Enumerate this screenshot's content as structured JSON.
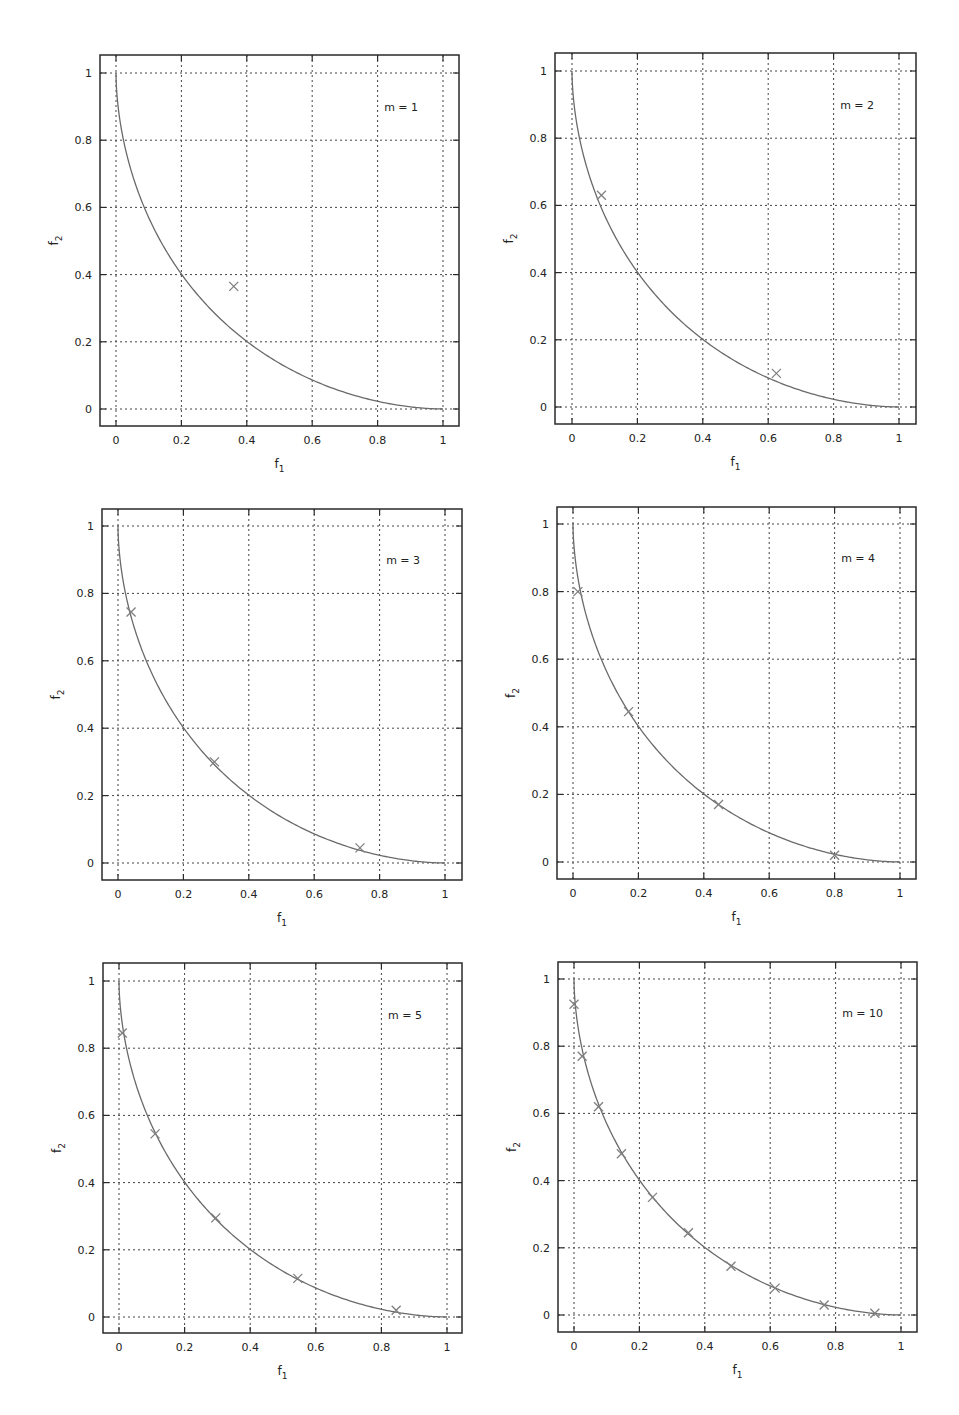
{
  "figure": {
    "panel_count": 6,
    "colors": {
      "frame": "#2a2a2a",
      "grid": "#444444",
      "curve": "#6a6a6a",
      "marker": "#808080",
      "text": "#222222"
    }
  },
  "chart_data": [
    {
      "type": "scatter",
      "title": "",
      "annotation": "m = 1",
      "xlabel": "f1",
      "ylabel": "f2",
      "xlim": [
        -0.05,
        1.05
      ],
      "ylim": [
        -0.05,
        1.05
      ],
      "xticks": [
        "0",
        "0.2",
        "0.4",
        "0.6",
        "0.8",
        "1"
      ],
      "yticks": [
        "0",
        "0.2",
        "0.4",
        "0.6",
        "0.8",
        "1"
      ],
      "grid": true,
      "pixel_frame": {
        "left": 100,
        "top": 55,
        "right": 459,
        "bottom": 426,
        "x0": 116,
        "x1": 443,
        "y0": 409,
        "y1": 73
      },
      "series": [
        {
          "name": "Pareto front",
          "kind": "line",
          "shape_exponent": 0.565
        },
        {
          "name": "solutions",
          "kind": "markers",
          "marker": "x",
          "points": [
            [
              0.36,
              0.365
            ]
          ]
        }
      ]
    },
    {
      "type": "scatter",
      "title": "",
      "annotation": "m = 2",
      "xlabel": "f1",
      "ylabel": "f2",
      "xlim": [
        -0.05,
        1.05
      ],
      "ylim": [
        -0.05,
        1.05
      ],
      "xticks": [
        "0",
        "0.2",
        "0.4",
        "0.6",
        "0.8",
        "1"
      ],
      "yticks": [
        "0",
        "0.2",
        "0.4",
        "0.6",
        "0.8",
        "1"
      ],
      "grid": true,
      "pixel_frame": {
        "left": 555,
        "top": 53,
        "right": 916,
        "bottom": 424,
        "x0": 572,
        "x1": 899,
        "y0": 407,
        "y1": 71
      },
      "series": [
        {
          "name": "Pareto front",
          "kind": "line",
          "shape_exponent": 0.565
        },
        {
          "name": "solutions",
          "kind": "markers",
          "marker": "x",
          "points": [
            [
              0.09,
              0.63
            ],
            [
              0.625,
              0.1
            ]
          ]
        }
      ]
    },
    {
      "type": "scatter",
      "title": "",
      "annotation": "m = 3",
      "xlabel": "f1",
      "ylabel": "f2",
      "xlim": [
        -0.05,
        1.05
      ],
      "ylim": [
        -0.05,
        1.05
      ],
      "xticks": [
        "0",
        "0.2",
        "0.4",
        "0.6",
        "0.8",
        "1"
      ],
      "yticks": [
        "0",
        "0.2",
        "0.4",
        "0.6",
        "0.8",
        "1"
      ],
      "grid": true,
      "pixel_frame": {
        "left": 102,
        "top": 509,
        "right": 462,
        "bottom": 880,
        "x0": 118,
        "x1": 445,
        "y0": 863,
        "y1": 526
      },
      "series": [
        {
          "name": "Pareto front",
          "kind": "line",
          "shape_exponent": 0.565
        },
        {
          "name": "solutions",
          "kind": "markers",
          "marker": "x",
          "points": [
            [
              0.04,
              0.745
            ],
            [
              0.295,
              0.3
            ],
            [
              0.74,
              0.045
            ]
          ]
        }
      ]
    },
    {
      "type": "scatter",
      "title": "",
      "annotation": "m = 4",
      "xlabel": "f1",
      "ylabel": "f2",
      "xlim": [
        -0.05,
        1.05
      ],
      "ylim": [
        -0.05,
        1.05
      ],
      "xticks": [
        "0",
        "0.2",
        "0.4",
        "0.6",
        "0.8",
        "1"
      ],
      "yticks": [
        "0",
        "0.2",
        "0.4",
        "0.6",
        "0.8",
        "1"
      ],
      "grid": true,
      "pixel_frame": {
        "left": 557,
        "top": 507,
        "right": 916,
        "bottom": 879,
        "x0": 573,
        "x1": 900,
        "y0": 862,
        "y1": 524
      },
      "series": [
        {
          "name": "Pareto front",
          "kind": "line",
          "shape_exponent": 0.565
        },
        {
          "name": "solutions",
          "kind": "markers",
          "marker": "x",
          "points": [
            [
              0.015,
              0.8
            ],
            [
              0.17,
              0.445
            ],
            [
              0.445,
              0.17
            ],
            [
              0.8,
              0.02
            ]
          ]
        }
      ]
    },
    {
      "type": "scatter",
      "title": "",
      "annotation": "m = 5",
      "xlabel": "f1",
      "ylabel": "f2",
      "xlim": [
        -0.05,
        1.05
      ],
      "ylim": [
        -0.05,
        1.05
      ],
      "xticks": [
        "0",
        "0.2",
        "0.4",
        "0.6",
        "0.8",
        "1"
      ],
      "yticks": [
        "0",
        "0.2",
        "0.4",
        "0.6",
        "0.8",
        "1"
      ],
      "grid": true,
      "pixel_frame": {
        "left": 103,
        "top": 963,
        "right": 462,
        "bottom": 1333,
        "x0": 119,
        "x1": 447,
        "y0": 1317,
        "y1": 981
      },
      "series": [
        {
          "name": "Pareto front",
          "kind": "line",
          "shape_exponent": 0.565
        },
        {
          "name": "solutions",
          "kind": "markers",
          "marker": "x",
          "points": [
            [
              0.01,
              0.845
            ],
            [
              0.11,
              0.545
            ],
            [
              0.295,
              0.295
            ],
            [
              0.545,
              0.115
            ],
            [
              0.845,
              0.02
            ]
          ]
        }
      ]
    },
    {
      "type": "scatter",
      "title": "",
      "annotation": "m = 10",
      "xlabel": "f1",
      "ylabel": "f2",
      "xlim": [
        -0.05,
        1.05
      ],
      "ylim": [
        -0.05,
        1.05
      ],
      "xticks": [
        "0",
        "0.2",
        "0.4",
        "0.6",
        "0.8",
        "1"
      ],
      "yticks": [
        "0",
        "0.2",
        "0.4",
        "0.6",
        "0.8",
        "1"
      ],
      "grid": true,
      "pixel_frame": {
        "left": 558,
        "top": 962,
        "right": 917,
        "bottom": 1332,
        "x0": 574,
        "x1": 901,
        "y0": 1315,
        "y1": 979
      },
      "series": [
        {
          "name": "Pareto front",
          "kind": "line",
          "shape_exponent": 0.565
        },
        {
          "name": "solutions",
          "kind": "markers",
          "marker": "x",
          "points": [
            [
              0.0,
              0.925
            ],
            [
              0.025,
              0.77
            ],
            [
              0.075,
              0.62
            ],
            [
              0.145,
              0.48
            ],
            [
              0.24,
              0.35
            ],
            [
              0.35,
              0.245
            ],
            [
              0.48,
              0.145
            ],
            [
              0.615,
              0.08
            ],
            [
              0.765,
              0.03
            ],
            [
              0.92,
              0.005
            ]
          ]
        }
      ]
    }
  ]
}
